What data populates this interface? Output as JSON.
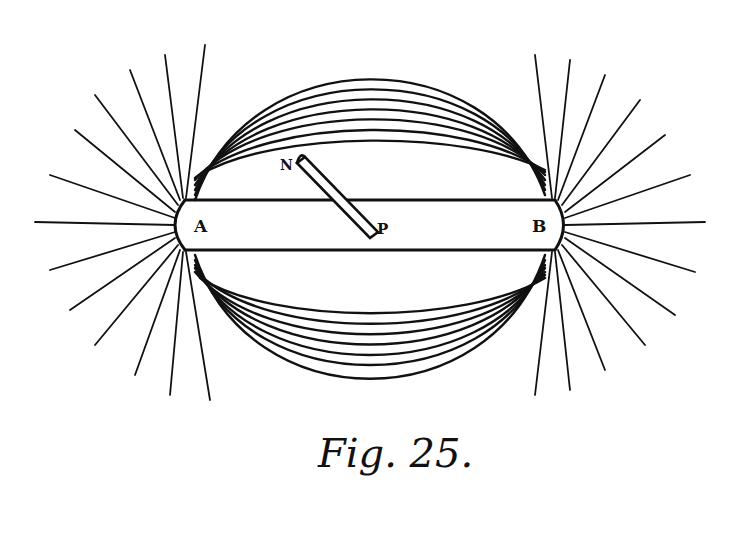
{
  "figure": {
    "caption": "Fig. 25.",
    "labels": {
      "pole_a": "A",
      "pole_b": "B",
      "needle_n": "N",
      "needle_p": "P"
    },
    "colors": {
      "ink": "#111111",
      "paper": "#ffffff"
    }
  }
}
